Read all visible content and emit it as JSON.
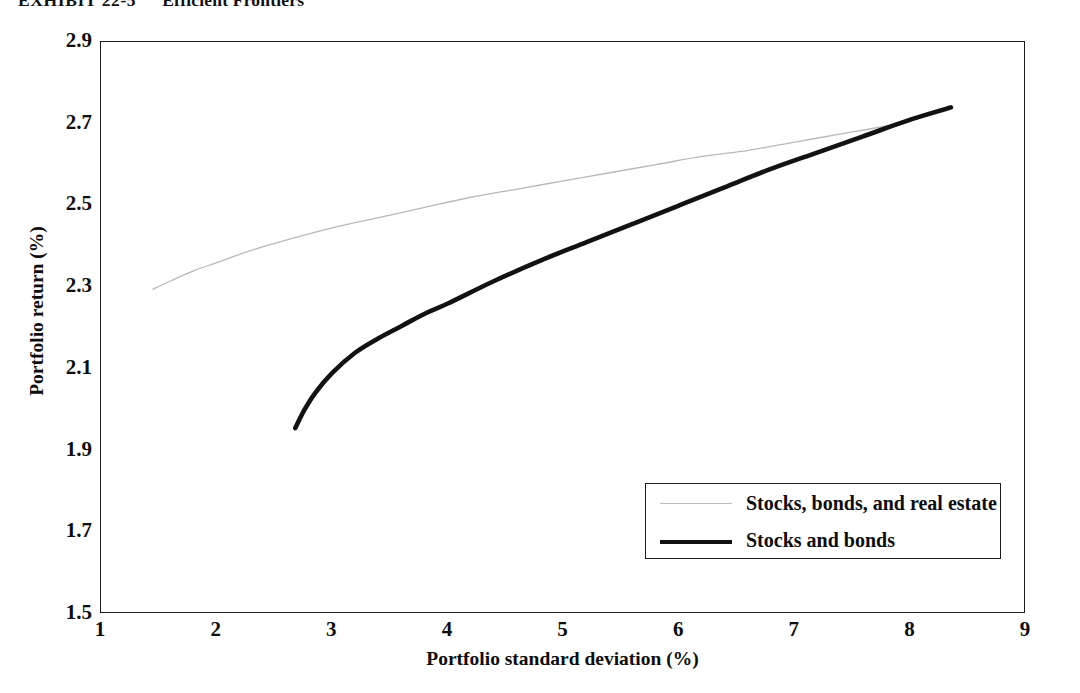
{
  "exhibit": {
    "label": "EXHIBIT 22-5",
    "name": "Efficient Frontiers"
  },
  "chart_data": {
    "type": "line",
    "title": "Efficient Frontiers",
    "xlabel": "Portfolio standard deviation (%)",
    "ylabel": "Portfolio return (%)",
    "xlim": [
      1,
      9
    ],
    "ylim": [
      1.5,
      2.9
    ],
    "xticks": [
      "1",
      "2",
      "3",
      "4",
      "5",
      "6",
      "7",
      "8",
      "9"
    ],
    "yticks": [
      "1.5",
      "1.7",
      "1.9",
      "2.1",
      "2.3",
      "2.5",
      "2.7",
      "2.9"
    ],
    "grid": false,
    "legend_position": "lower right",
    "series": [
      {
        "name": "Stocks, bonds, and real estate",
        "color": "#b9b9b9",
        "line_width": 1.3,
        "x": [
          1.45,
          1.6,
          1.8,
          2.0,
          2.3,
          2.6,
          3.0,
          3.4,
          3.8,
          4.2,
          4.6,
          5.0,
          5.4,
          5.8,
          6.2,
          6.6,
          7.0,
          7.4,
          7.8,
          8.1,
          8.35
        ],
        "y": [
          2.295,
          2.315,
          2.34,
          2.36,
          2.39,
          2.415,
          2.445,
          2.47,
          2.495,
          2.52,
          2.54,
          2.56,
          2.58,
          2.6,
          2.62,
          2.635,
          2.655,
          2.675,
          2.695,
          2.715,
          2.735
        ]
      },
      {
        "name": "Stocks and bonds",
        "color": "#121212",
        "line_width": 4.6,
        "x": [
          2.68,
          2.75,
          2.85,
          3.0,
          3.2,
          3.4,
          3.6,
          3.8,
          4.0,
          4.4,
          4.8,
          5.2,
          5.6,
          6.0,
          6.4,
          6.8,
          7.2,
          7.6,
          8.0,
          8.35
        ],
        "y": [
          1.955,
          1.995,
          2.04,
          2.09,
          2.14,
          2.175,
          2.205,
          2.235,
          2.26,
          2.315,
          2.365,
          2.41,
          2.455,
          2.5,
          2.545,
          2.59,
          2.63,
          2.67,
          2.71,
          2.74
        ]
      }
    ]
  },
  "legend": {
    "entries": [
      {
        "label": "Stocks, bonds, and real estate",
        "style": "gray-thin"
      },
      {
        "label": "Stocks and bonds",
        "style": "black-thick"
      }
    ]
  }
}
